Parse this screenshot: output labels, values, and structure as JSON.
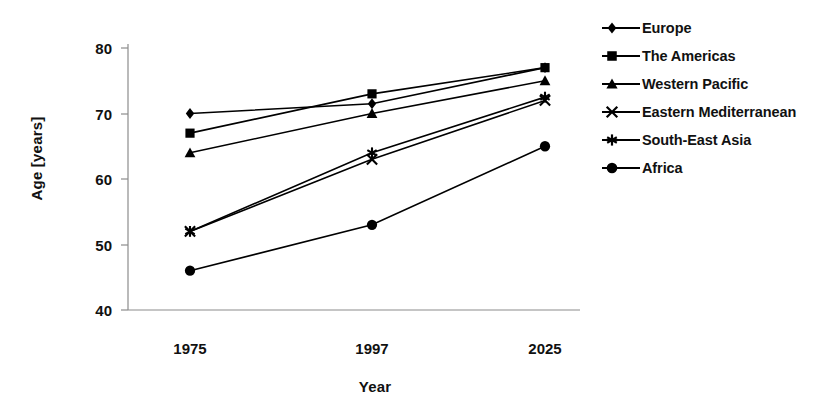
{
  "chart_data": {
    "type": "line",
    "title": "",
    "xlabel": "Year",
    "ylabel": "Age [years]",
    "categories": [
      "1975",
      "1997",
      "2025"
    ],
    "x": [
      1975,
      1997,
      2025
    ],
    "ylim": [
      40,
      80
    ],
    "yticks": [
      40,
      50,
      60,
      70,
      80
    ],
    "grid": false,
    "legend_position": "right",
    "series": [
      {
        "name": "Europe",
        "marker": "diamond",
        "values": [
          70,
          71.5,
          77
        ]
      },
      {
        "name": "The Americas",
        "marker": "square",
        "values": [
          67,
          73,
          77
        ]
      },
      {
        "name": "Western Pacific",
        "marker": "triangle",
        "values": [
          64,
          70,
          75
        ]
      },
      {
        "name": "Eastern Mediterranean",
        "marker": "x",
        "values": [
          52,
          63,
          72
        ]
      },
      {
        "name": "South-East Asia",
        "marker": "asterisk",
        "values": [
          52,
          64,
          72.5
        ]
      },
      {
        "name": "Africa",
        "marker": "circle",
        "values": [
          46,
          53,
          65
        ]
      }
    ]
  },
  "axes": {
    "y_title": "Age [years]",
    "x_title": "Year",
    "y_tick_labels": [
      "80",
      "70",
      "60",
      "50",
      "40"
    ],
    "x_tick_labels": [
      "1975",
      "1997",
      "2025"
    ]
  },
  "legend": {
    "items": [
      {
        "label": "Europe",
        "marker": "diamond"
      },
      {
        "label": "The Americas",
        "marker": "square"
      },
      {
        "label": "Western Pacific",
        "marker": "triangle"
      },
      {
        "label": "Eastern Mediterranean",
        "marker": "x"
      },
      {
        "label": "South-East Asia",
        "marker": "asterisk"
      },
      {
        "label": "Africa",
        "marker": "circle"
      }
    ]
  },
  "colors": {
    "series": "#000000",
    "axis": "#808080",
    "text": "#111111",
    "background": "#ffffff"
  }
}
